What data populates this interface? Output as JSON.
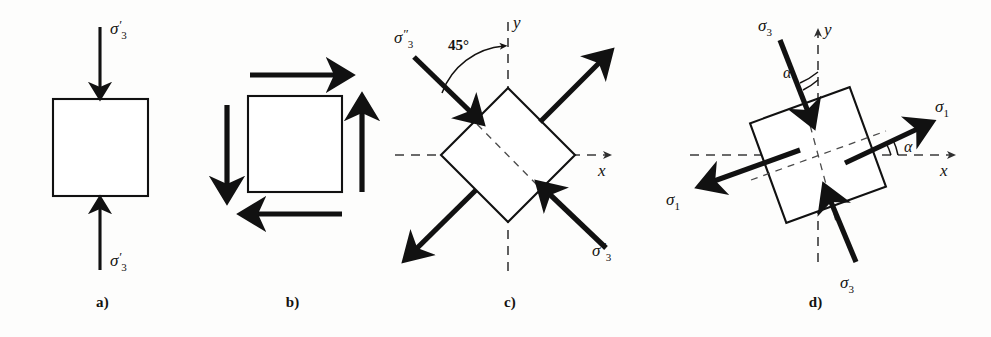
{
  "figure": {
    "background_color": "#fdfdfc",
    "ink_color": "#111111"
  },
  "panels": [
    {
      "id": "a",
      "caption": "a)",
      "description": "Square element under vertical compression",
      "labels": {
        "top_stress": "σ",
        "top_prime": "′",
        "top_sub": "3",
        "bottom_stress": "σ",
        "bottom_prime": "′",
        "bottom_sub": "3"
      },
      "arrows": [
        {
          "name": "top-compression-arrow",
          "direction": "down"
        },
        {
          "name": "bottom-compression-arrow",
          "direction": "up"
        }
      ]
    },
    {
      "id": "b",
      "caption": "b)",
      "description": "Square element under pure shear couple",
      "arrows": [
        {
          "name": "top-shear-arrow",
          "direction": "right"
        },
        {
          "name": "bottom-shear-arrow",
          "direction": "left"
        },
        {
          "name": "left-shear-arrow",
          "direction": "down"
        },
        {
          "name": "right-shear-arrow",
          "direction": "up"
        }
      ]
    },
    {
      "id": "c",
      "caption": "c)",
      "description": "Element rotated 45 degrees with principal stresses",
      "angle_label": "45°",
      "axis_x": "x",
      "axis_y": "y",
      "labels": {
        "upper_left_stress": "σ",
        "upper_left_prime": "″",
        "upper_left_sub": "3",
        "lower_right_stress": "σ",
        "lower_right_prime": "″",
        "lower_right_sub": "3"
      },
      "arrows": [
        {
          "name": "upper-left-compression-arrow",
          "direction": "down-right"
        },
        {
          "name": "lower-right-compression-arrow",
          "direction": "up-left"
        },
        {
          "name": "upper-right-tension-arrow",
          "direction": "up-right"
        },
        {
          "name": "lower-left-tension-arrow",
          "direction": "down-left"
        }
      ]
    },
    {
      "id": "d",
      "caption": "d)",
      "description": "Element rotated by angle alpha with principal stresses sigma1 and sigma3",
      "angle_label": "α",
      "axis_x": "x",
      "axis_y": "y",
      "labels": {
        "top_stress": "σ",
        "top_sub": "3",
        "bottom_stress": "σ",
        "bottom_sub": "3",
        "right_stress": "σ",
        "right_sub": "1",
        "left_stress": "σ",
        "left_sub": "1"
      },
      "arrows": [
        {
          "name": "top-sigma3-arrow",
          "direction": "down-right"
        },
        {
          "name": "bottom-sigma3-arrow",
          "direction": "up-left"
        },
        {
          "name": "right-sigma1-arrow",
          "direction": "up-right"
        },
        {
          "name": "left-sigma1-arrow",
          "direction": "down-left"
        }
      ],
      "rotation_degrees": 20
    }
  ]
}
